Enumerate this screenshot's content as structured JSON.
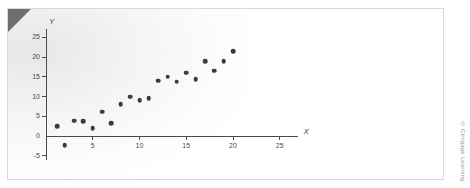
{
  "figure": {
    "credit": "© Cengage Learning",
    "corner_fold_color": "#6e6e6e",
    "point_color": "#3b3b3b",
    "axis_color": "#4a4a4a",
    "border_color": "#d9d9d9"
  },
  "chart_data": {
    "type": "scatter",
    "title": "",
    "subtitle": "",
    "xlabel": "X",
    "ylabel": "Y",
    "xlim": [
      0,
      27
    ],
    "ylim": [
      -6,
      27
    ],
    "xticks": [
      5,
      10,
      15,
      20,
      25
    ],
    "xtick_labels": [
      "5",
      "10",
      "15",
      "20",
      "25"
    ],
    "yticks": [
      -5,
      0,
      5,
      10,
      15,
      20,
      25
    ],
    "ytick_labels": [
      "-5",
      "0",
      "5",
      "10",
      "15",
      "20",
      "25"
    ],
    "grid": false,
    "legend": false,
    "legend_position": "none",
    "series": [
      {
        "name": "observations",
        "marker": "circle",
        "color": "#3b3b3b",
        "points": [
          {
            "x": 1.2,
            "y": 2.5
          },
          {
            "x": 2.0,
            "y": -2.4
          },
          {
            "x": 3.0,
            "y": 3.9
          },
          {
            "x": 4.0,
            "y": 3.7
          },
          {
            "x": 5.0,
            "y": 1.9
          },
          {
            "x": 6.0,
            "y": 6.1
          },
          {
            "x": 7.0,
            "y": 3.2
          },
          {
            "x": 8.0,
            "y": 8.0
          },
          {
            "x": 9.0,
            "y": 10.0
          },
          {
            "x": 10.0,
            "y": 9.1
          },
          {
            "x": 11.0,
            "y": 9.6
          },
          {
            "x": 12.0,
            "y": 14.0
          },
          {
            "x": 13.0,
            "y": 15.0
          },
          {
            "x": 14.0,
            "y": 13.7
          },
          {
            "x": 15.0,
            "y": 16.0
          },
          {
            "x": 16.0,
            "y": 14.4
          },
          {
            "x": 17.0,
            "y": 19.0
          },
          {
            "x": 18.0,
            "y": 16.5
          },
          {
            "x": 19.0,
            "y": 19.0
          },
          {
            "x": 20.0,
            "y": 21.5
          }
        ]
      }
    ]
  }
}
